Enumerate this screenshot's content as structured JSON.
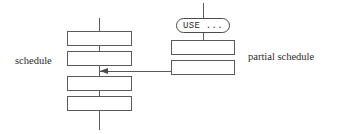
{
  "diagram": {
    "background_color": "#ffffff",
    "stroke_color": "#5a5a5a",
    "text_color": "#2b2b2b",
    "labels": {
      "left": "schedule",
      "right": "partial schedule"
    },
    "nodes": {
      "use_oval": "USE ..."
    },
    "left_column": {
      "name": "schedule",
      "box_count": 4,
      "boxes": [
        {
          "id": "left-box-1",
          "label": ""
        },
        {
          "id": "left-box-2",
          "label": ""
        },
        {
          "id": "left-box-3",
          "label": ""
        },
        {
          "id": "left-box-4",
          "label": ""
        }
      ]
    },
    "right_column": {
      "name": "partial schedule",
      "box_count": 2,
      "boxes": [
        {
          "id": "right-box-1",
          "label": ""
        },
        {
          "id": "right-box-2",
          "label": ""
        }
      ]
    },
    "connector": {
      "kind": "arrow",
      "direction": "left",
      "from": "right-box-2",
      "to": "left-spine"
    }
  }
}
